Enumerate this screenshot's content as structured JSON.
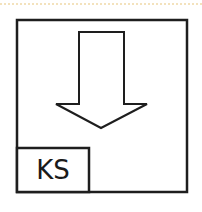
{
  "symbol": {
    "label": "KS",
    "arrow_direction": "down",
    "stroke_color": "#1e1e1e",
    "background_color": "#ffffff",
    "top_border_color": "#f3e2bd"
  }
}
